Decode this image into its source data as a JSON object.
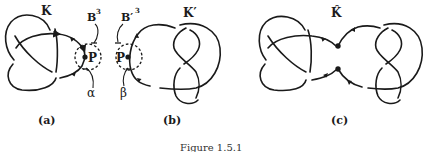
{
  "figure": {
    "caption": "Figure 1.5.1",
    "panels": [
      {
        "id": "a",
        "label": "(a)",
        "knot_label": "K",
        "ball_label": "B",
        "ball_sup": "3",
        "point_label": "P",
        "arc_label": "α",
        "knot_type": "trefoil"
      },
      {
        "id": "b",
        "label": "(b)",
        "knot_label": "K′",
        "ball_label": "B′",
        "ball_sup": "3",
        "point_label": "P",
        "arc_label": "β",
        "knot_type": "figure-eight"
      },
      {
        "id": "c",
        "label": "(c)",
        "knot_label": "K̂",
        "knot_type": "connected-sum"
      }
    ]
  },
  "colors": {
    "stroke": "#1a1a1a",
    "background": "#ffffff"
  }
}
